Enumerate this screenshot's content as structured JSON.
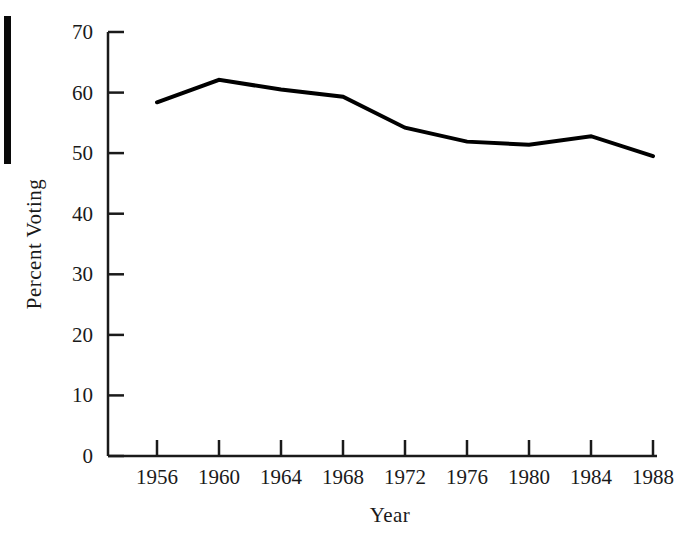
{
  "chart_data": {
    "type": "line",
    "title": "",
    "xlabel": "Year",
    "ylabel": "Percent Voting",
    "x": [
      1956,
      1960,
      1964,
      1968,
      1972,
      1976,
      1980,
      1984,
      1988
    ],
    "values": [
      58.4,
      62.1,
      60.5,
      59.3,
      54.2,
      51.9,
      51.4,
      52.8,
      49.5
    ],
    "series": [
      {
        "name": "Percent Voting",
        "values": [
          58.4,
          62.1,
          60.5,
          59.3,
          54.2,
          51.9,
          51.4,
          52.8,
          49.5
        ]
      }
    ],
    "xticklabels": [
      "1956",
      "1960",
      "1964",
      "1968",
      "1972",
      "1976",
      "1980",
      "1984",
      "1988"
    ],
    "yticklabels": [
      "0",
      "10",
      "20",
      "30",
      "40",
      "50",
      "60",
      "70"
    ],
    "yticks": [
      0,
      10,
      20,
      30,
      40,
      50,
      60,
      70
    ],
    "xlim": [
      1954,
      1990
    ],
    "ylim": [
      0,
      70
    ],
    "grid": false,
    "legend": false,
    "line_color": "#000000",
    "line_width": 4,
    "axis_color": "#1a1a1a"
  },
  "axes": {
    "y_title": "Percent Voting",
    "x_title": "Year",
    "y_ticks": [
      {
        "label": "70",
        "value": 70
      },
      {
        "label": "60",
        "value": 60
      },
      {
        "label": "50",
        "value": 50
      },
      {
        "label": "40",
        "value": 40
      },
      {
        "label": "30",
        "value": 30
      },
      {
        "label": "20",
        "value": 20
      },
      {
        "label": "10",
        "value": 10
      },
      {
        "label": "0",
        "value": 0
      }
    ],
    "x_ticks": [
      {
        "label": "1956",
        "value": 1956
      },
      {
        "label": "1960",
        "value": 1960
      },
      {
        "label": "1964",
        "value": 1964
      },
      {
        "label": "1968",
        "value": 1968
      },
      {
        "label": "1972",
        "value": 1972
      },
      {
        "label": "1976",
        "value": 1976
      },
      {
        "label": "1980",
        "value": 1980
      },
      {
        "label": "1984",
        "value": 1984
      },
      {
        "label": "1988",
        "value": 1988
      }
    ]
  }
}
